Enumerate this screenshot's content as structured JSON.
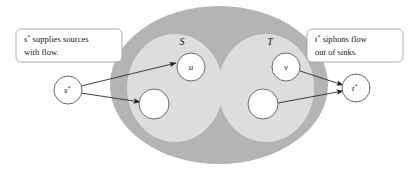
{
  "figure": {
    "kind": "flow-network-diagram",
    "background_color": "#ffffff"
  },
  "colors": {
    "outer_region_fill": "#b3b3b3",
    "inner_region_fill": "#dcdcdc",
    "node_fill": "#ffffff",
    "stroke": "#4d4d4d",
    "edge": "#333333",
    "text": "#1a1a1a",
    "callout_fill": "#ffffff",
    "callout_border": "#9a9a9a"
  },
  "callouts": [
    {
      "id": "left-callout",
      "name": "source-callout",
      "lines": [
        "s* supplies sources",
        "with flow."
      ],
      "line1_symbol": "s",
      "line1_superscript": "*",
      "line1_rest": " supplies sources",
      "line2": "with flow.",
      "x": 16,
      "y": 29,
      "width": 106,
      "height": 33
    },
    {
      "id": "right-callout",
      "name": "sink-callout",
      "lines": [
        "t* siphons flow",
        "out of sinks."
      ],
      "line1_symbol": "t",
      "line1_superscript": "*",
      "line1_rest": " siphons flow",
      "line2": "out of sinks.",
      "x": 307,
      "y": 29,
      "width": 96,
      "height": 33
    }
  ],
  "regions": [
    {
      "id": "outer",
      "name": "network-region",
      "label": "",
      "cx": 219,
      "cy": 85,
      "rx": 109,
      "ry": 79
    },
    {
      "id": "S",
      "name": "sources-region",
      "label": "S",
      "label_x": 182,
      "label_y": 45,
      "cx": 175,
      "cy": 88,
      "rx": 48,
      "ry": 54
    },
    {
      "id": "T",
      "name": "sinks-region",
      "label": "T",
      "label_x": 270,
      "label_y": 45,
      "cx": 266,
      "cy": 88,
      "rx": 48,
      "ry": 54
    }
  ],
  "nodes": [
    {
      "id": "s-star",
      "name": "super-source-node",
      "label": "s",
      "superscript": "*",
      "cx": 68,
      "cy": 90,
      "r": 14
    },
    {
      "id": "u",
      "name": "source-node-u",
      "label": "u",
      "superscript": "",
      "cx": 191,
      "cy": 67,
      "r": 14
    },
    {
      "id": "s2",
      "name": "source-node-unlabeled",
      "label": "",
      "superscript": "",
      "cx": 154,
      "cy": 104,
      "r": 15
    },
    {
      "id": "v",
      "name": "sink-node-v",
      "label": "v",
      "superscript": "",
      "cx": 286,
      "cy": 67,
      "r": 14
    },
    {
      "id": "t2",
      "name": "sink-node-unlabeled",
      "label": "",
      "superscript": "",
      "cx": 263,
      "cy": 104,
      "r": 15
    },
    {
      "id": "t-star",
      "name": "super-sink-node",
      "label": "t",
      "superscript": "*",
      "cx": 356,
      "cy": 88,
      "r": 14
    }
  ],
  "edges": [
    {
      "id": "e1",
      "name": "edge-sstar-to-u",
      "from": "s-star",
      "to": "u",
      "x1": 81,
      "y1": 86,
      "x2": 176,
      "y2": 63
    },
    {
      "id": "e2",
      "name": "edge-sstar-to-source2",
      "from": "s-star",
      "to": "s2",
      "x1": 81,
      "y1": 93,
      "x2": 140,
      "y2": 102
    },
    {
      "id": "e3",
      "name": "edge-v-to-tstar",
      "from": "v",
      "to": "t-star",
      "x1": 300,
      "y1": 71,
      "x2": 343,
      "y2": 85
    },
    {
      "id": "e4",
      "name": "edge-sink2-to-tstar",
      "from": "t2",
      "to": "t-star",
      "x1": 278,
      "y1": 103,
      "x2": 343,
      "y2": 91
    }
  ]
}
